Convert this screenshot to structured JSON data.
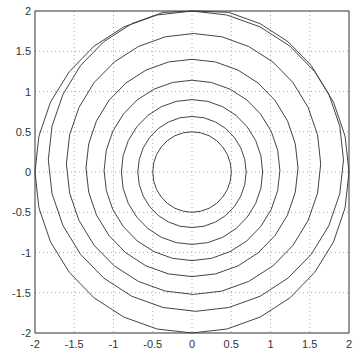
{
  "chart_data": {
    "type": "line",
    "subtype": "contour",
    "title": "",
    "xlabel": "",
    "ylabel": "",
    "xlim": [
      -2,
      2
    ],
    "ylim": [
      -2,
      2
    ],
    "grid": true,
    "grid_style": "dotted",
    "x_ticks": [
      "-2",
      "-1.5",
      "-1",
      "-0.5",
      "0",
      "0.5",
      "1",
      "1.5",
      "2"
    ],
    "y_ticks": [
      "2",
      "1.5",
      "1",
      "0.5",
      "0",
      "-0.5",
      "-1",
      "-1.5",
      "-2"
    ],
    "x_tick_values": [
      -2,
      -1.5,
      -1,
      -0.5,
      0,
      0.5,
      1,
      1.5,
      2
    ],
    "y_tick_values": [
      2,
      1.5,
      1,
      0.5,
      0,
      -0.5,
      -1,
      -1.5,
      -2
    ],
    "contours": [
      {
        "cx": 0.0,
        "cy": 0.0,
        "r": 0.5
      },
      {
        "cx": 0.0,
        "cy": 0.0,
        "r": 0.69
      },
      {
        "cx": 0.0,
        "cy": 0.0,
        "r": 0.9
      },
      {
        "cx": 0.0,
        "cy": 0.02,
        "r": 1.12
      },
      {
        "cx": 0.0,
        "cy": 0.05,
        "r": 1.35
      },
      {
        "cx": 0.02,
        "cy": 0.1,
        "r": 1.62
      },
      {
        "cx": 0.05,
        "cy": 0.15,
        "r": 1.88
      },
      {
        "cx": 0.0,
        "cy": 0.0,
        "r": 2.0
      }
    ],
    "line_color": "#444444",
    "legend": []
  }
}
